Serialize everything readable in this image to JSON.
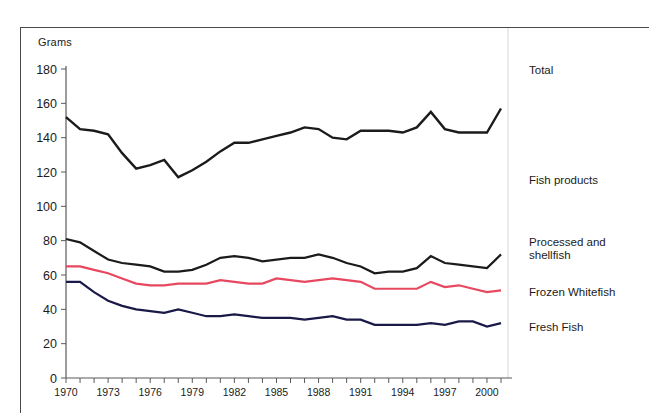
{
  "figure": {
    "y_axis_unit_label": "Grams",
    "y_ticks": [
      0,
      20,
      40,
      60,
      80,
      100,
      120,
      140,
      160,
      180
    ],
    "x_ticks_labeled": [
      1970,
      1973,
      1976,
      1979,
      1982,
      1985,
      1988,
      1991,
      1994,
      1997,
      2000
    ],
    "series_colors": {
      "total": "#1b1b1b",
      "fish_products": "#1b1b1b",
      "processed_and_shellfish": "#1b1b1b",
      "frozen_whitefish": "#e8485f",
      "fresh_fish": "#1a1a48"
    },
    "labels": {
      "total": "Total",
      "fish_products": "Fish products",
      "processed_and_shellfish": "Processed and shellfish",
      "processed_and_shellfish_line1": "Processed and",
      "processed_and_shellfish_line2": "shellfish",
      "frozen_whitefish": "Frozen Whitefish",
      "fresh_fish": "Fresh Fish"
    }
  },
  "chart_data": {
    "type": "line",
    "title": "",
    "subtitle": "",
    "xlabel": "",
    "ylabel": "Grams",
    "xlim": [
      1970,
      2001
    ],
    "ylim": [
      0,
      180
    ],
    "grid": false,
    "legend_position": "right-inline-labels",
    "annotations": [
      "Total",
      "Fish products",
      "Processed and shellfish",
      "Frozen Whitefish",
      "Fresh Fish"
    ],
    "x": [
      1970,
      1971,
      1972,
      1973,
      1974,
      1975,
      1976,
      1977,
      1978,
      1979,
      1980,
      1981,
      1982,
      1983,
      1984,
      1985,
      1986,
      1987,
      1988,
      1989,
      1990,
      1991,
      1992,
      1993,
      1994,
      1995,
      1996,
      1997,
      1998,
      1999,
      2000,
      2001
    ],
    "tick_labels_x": [
      "1970",
      "",
      "",
      "1973",
      "",
      "",
      "1976",
      "",
      "",
      "1979",
      "",
      "",
      "1982",
      "",
      "",
      "1985",
      "",
      "",
      "1988",
      "",
      "",
      "1991",
      "",
      "",
      "1994",
      "",
      "",
      "1997",
      "",
      "",
      "2000",
      ""
    ],
    "tick_labels_y": [
      "0",
      "20",
      "40",
      "60",
      "80",
      "100",
      "120",
      "140",
      "160",
      "180"
    ],
    "series": [
      {
        "name": "Total",
        "color": "#1b1b1b",
        "width": 2.4,
        "values": [
          152,
          145,
          144,
          142,
          131,
          122,
          124,
          127,
          117,
          121,
          126,
          132,
          137,
          137,
          139,
          141,
          143,
          146,
          145,
          140,
          139,
          144,
          144,
          144,
          143,
          146,
          155,
          145,
          143,
          143,
          143,
          157
        ]
      },
      {
        "name": "Processed and shellfish",
        "color": "#1b1b1b",
        "width": 2.2,
        "values": [
          81,
          79,
          74,
          69,
          67,
          66,
          65,
          62,
          62,
          63,
          66,
          70,
          71,
          70,
          68,
          69,
          70,
          70,
          72,
          70,
          67,
          65,
          61,
          62,
          62,
          64,
          71,
          67,
          66,
          65,
          64,
          72
        ]
      },
      {
        "name": "Frozen Whitefish",
        "color": "#e8485f",
        "width": 2.2,
        "values": [
          65,
          65,
          63,
          61,
          58,
          55,
          54,
          54,
          55,
          55,
          55,
          57,
          56,
          55,
          55,
          58,
          57,
          56,
          57,
          58,
          57,
          56,
          52,
          52,
          52,
          52,
          56,
          53,
          54,
          52,
          50,
          51
        ]
      },
      {
        "name": "Fresh Fish",
        "color": "#1a1a48",
        "width": 2.2,
        "values": [
          56,
          56,
          50,
          45,
          42,
          40,
          39,
          38,
          40,
          38,
          36,
          36,
          37,
          36,
          35,
          35,
          35,
          34,
          35,
          36,
          34,
          34,
          31,
          31,
          31,
          31,
          32,
          31,
          33,
          33,
          30,
          32
        ]
      }
    ]
  }
}
